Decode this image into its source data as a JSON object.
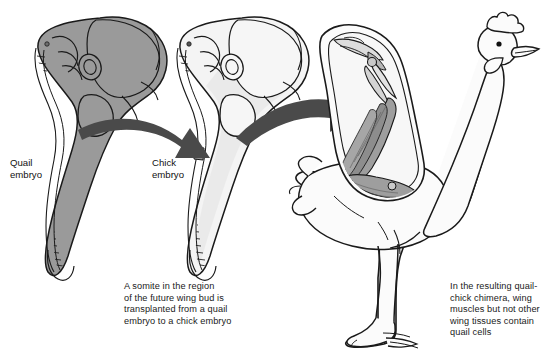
{
  "figure": {
    "background_color": "#ffffff",
    "width": 559,
    "height": 358
  },
  "palette": {
    "quail_fill": "#9a9a9a",
    "quail_dark_fill": "#8a8a8a",
    "chick_fill": "#f2f2f2",
    "chick_shadow": "#e2e2e2",
    "somite_graft": "#8f8f8f",
    "arrow_fill": "#4a4a4a",
    "outline": "#1a1a1a",
    "muscle_fill": "#9e9e9e",
    "muscle_dark": "#7d7d7d",
    "bone_fill": "#dcdcdc",
    "text_color": "#1a1a1a"
  },
  "labels": {
    "quail_embryo": "Quail\nembryo",
    "chick_embryo": "Chick\nembryo"
  },
  "captions": {
    "center": "A somite in the region\nof the future wing bud is\ntransplanted from a quail\nembryo to a chick embryo",
    "right": "In the resulting quail-\nchick chimera, wing\nmuscles but not other\nwing tissues contain\nquail cells"
  },
  "panels": [
    {
      "id": "quail-embryo",
      "name": "Quail embryo",
      "description": "Shaded gray curled avian embryo with segmented somites along the neural tube, prominent brain vesicles and optic vesicle, long curving tail",
      "fill": "#9a9a9a"
    },
    {
      "id": "chick-embryo",
      "name": "Chick embryo",
      "description": "Unshaded white curled avian embryo of the same stage with a single dark gray grafted somite at the prospective wing bud level",
      "fill": "#f2f2f2"
    },
    {
      "id": "chimera-chicken",
      "name": "Quail-chick chimera",
      "description": "Adult white chicken standing in profile with the near wing lifted and dissected open, revealing gray quail-derived wing musculature and pale skeletal elements",
      "fill": "#fbfbfb"
    }
  ],
  "arrows": [
    {
      "id": "arrow-graft",
      "name": "quail-to-chick transplant arrow",
      "direction": "right-down",
      "color": "#4a4a4a"
    },
    {
      "id": "arrow-result",
      "name": "chick-to-chimera development arrow",
      "direction": "right",
      "color": "#4a4a4a"
    }
  ]
}
